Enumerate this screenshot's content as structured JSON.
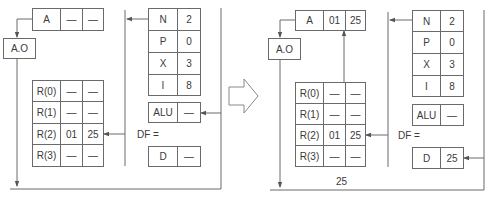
{
  "figure": {
    "before": {
      "accumulator": {
        "label": "A",
        "high": "—",
        "low": "—"
      },
      "address_output": "A.O",
      "registers": [
        {
          "name": "R(0)",
          "high": "—",
          "low": "—"
        },
        {
          "name": "R(1)",
          "high": "—",
          "low": "—"
        },
        {
          "name": "R(2)",
          "high": "01",
          "low": "25"
        },
        {
          "name": "R(3)",
          "high": "—",
          "low": "—"
        }
      ],
      "control": [
        {
          "name": "N",
          "value": "2"
        },
        {
          "name": "P",
          "value": "0"
        },
        {
          "name": "X",
          "value": "3"
        },
        {
          "name": "I",
          "value": "8"
        }
      ],
      "alu": {
        "label": "ALU",
        "value": "—"
      },
      "df_label": "DF =",
      "data": {
        "label": "D",
        "value": "—"
      }
    },
    "transition_arrow": "right-arrow",
    "after": {
      "accumulator": {
        "label": "A",
        "high": "01",
        "low": "25"
      },
      "address_output": "A.O",
      "registers": [
        {
          "name": "R(0)",
          "high": "—",
          "low": "—"
        },
        {
          "name": "R(1)",
          "high": "—",
          "low": "—"
        },
        {
          "name": "R(2)",
          "high": "01",
          "low": "25"
        },
        {
          "name": "R(3)",
          "high": "—",
          "low": "—"
        }
      ],
      "control": [
        {
          "name": "N",
          "value": "2"
        },
        {
          "name": "P",
          "value": "0"
        },
        {
          "name": "X",
          "value": "3"
        },
        {
          "name": "I",
          "value": "8"
        }
      ],
      "alu": {
        "label": "ALU",
        "value": "—"
      },
      "df_label": "DF =",
      "data": {
        "label": "D",
        "value": "25"
      },
      "bus_value": "25"
    },
    "colors": {
      "line": "#6a6a6a",
      "text": "#3a3a3a",
      "background": "#ffffff"
    }
  }
}
